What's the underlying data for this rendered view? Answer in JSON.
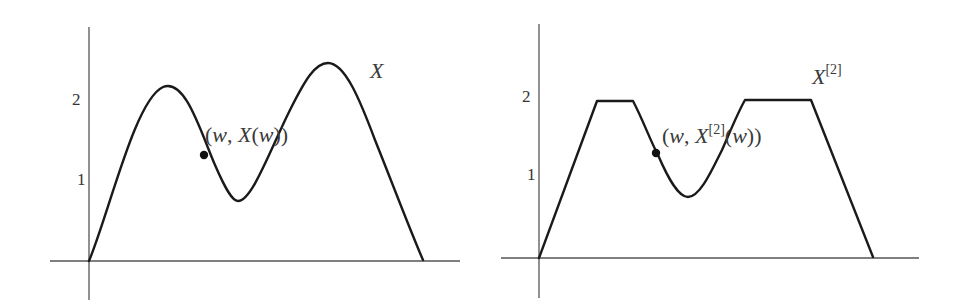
{
  "panels": [
    {
      "id": "left",
      "curve_label": "X",
      "curve_label_sup": "",
      "point_label": {
        "open": "(",
        "w": "w",
        "comma": ", ",
        "func": "X",
        "sup": "",
        "arg": "(w))"
      },
      "y_ticks": [
        {
          "value": 1,
          "label": "1"
        },
        {
          "value": 2,
          "label": "2"
        }
      ],
      "curve_description": "smooth function starting at 0, peak ~2.2, trough ~0.75, peak ~2.5, returning to 0",
      "curve_points": [
        [
          0,
          0
        ],
        [
          0.6,
          1.1
        ],
        [
          1.0,
          1.9
        ],
        [
          1.35,
          2.2
        ],
        [
          1.7,
          1.9
        ],
        [
          2.0,
          1.4
        ],
        [
          2.3,
          0.95
        ],
        [
          2.6,
          0.75
        ],
        [
          2.9,
          1.0
        ],
        [
          3.2,
          1.6
        ],
        [
          3.5,
          2.2
        ],
        [
          3.75,
          2.5
        ],
        [
          4.05,
          2.3
        ],
        [
          4.4,
          1.6
        ],
        [
          4.8,
          0.8
        ],
        [
          5.2,
          0
        ]
      ],
      "marked_point": {
        "x": 2.1,
        "y": 1.3
      }
    },
    {
      "id": "right",
      "curve_label": "X",
      "curve_label_sup": "[2]",
      "point_label": {
        "open": "(",
        "w": "w",
        "comma": ", ",
        "func": "X",
        "sup": "[2]",
        "arg": "(w))"
      },
      "y_ticks": [
        {
          "value": 1,
          "label": "1"
        },
        {
          "value": 2,
          "label": "2"
        }
      ],
      "curve_description": "X truncated at level 2: plateaus at height 2 where X exceeds 2",
      "cap_level": 2,
      "curve_points": [
        [
          0,
          0
        ],
        [
          0.86,
          2.0
        ],
        [
          1.4,
          2.0
        ],
        [
          1.7,
          1.45
        ],
        [
          2.0,
          1.0
        ],
        [
          2.3,
          0.75
        ],
        [
          2.6,
          1.0
        ],
        [
          2.9,
          1.5
        ],
        [
          3.2,
          2.0
        ],
        [
          4.35,
          2.0
        ],
        [
          5.2,
          0
        ]
      ],
      "marked_point": {
        "x": 1.77,
        "y": 1.33
      }
    }
  ]
}
